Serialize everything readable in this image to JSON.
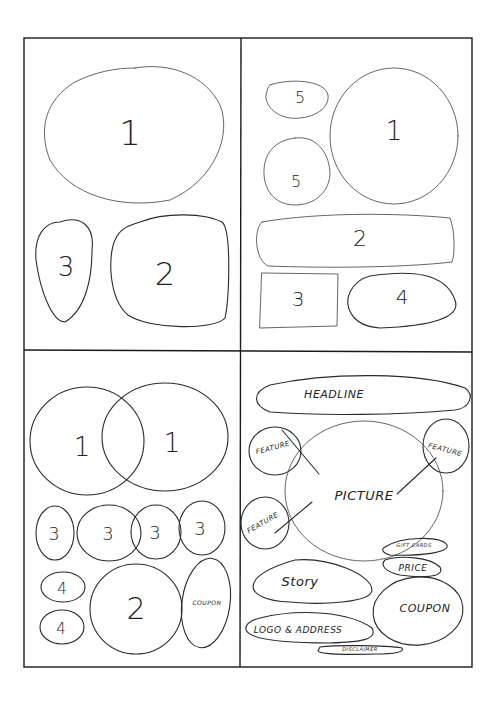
{
  "diagram": {
    "type": "hand-drawn layout wireframe sketches",
    "panels": [
      {
        "position": "top-left",
        "shapes": [
          {
            "id": "tl-1",
            "label": "1",
            "shape": "large oval"
          },
          {
            "id": "tl-3",
            "label": "3",
            "shape": "tall oval"
          },
          {
            "id": "tl-2",
            "label": "2",
            "shape": "rounded square"
          }
        ]
      },
      {
        "position": "top-right",
        "shapes": [
          {
            "id": "tr-5a",
            "label": "5",
            "shape": "small oval"
          },
          {
            "id": "tr-5b",
            "label": "5",
            "shape": "small circle"
          },
          {
            "id": "tr-1",
            "label": "1",
            "shape": "large circle"
          },
          {
            "id": "tr-2",
            "label": "2",
            "shape": "wide rounded bar"
          },
          {
            "id": "tr-3",
            "label": "3",
            "shape": "rectangle"
          },
          {
            "id": "tr-4",
            "label": "4",
            "shape": "oval"
          }
        ]
      },
      {
        "position": "bottom-left",
        "shapes": [
          {
            "id": "bl-1a",
            "label": "1",
            "shape": "large circle"
          },
          {
            "id": "bl-1b",
            "label": "1",
            "shape": "large circle (overlapping)"
          },
          {
            "id": "bl-3a",
            "label": "3",
            "shape": "small oval"
          },
          {
            "id": "bl-3b",
            "label": "3",
            "shape": "oval"
          },
          {
            "id": "bl-3c",
            "label": "3",
            "shape": "oval"
          },
          {
            "id": "bl-3d",
            "label": "3",
            "shape": "oval"
          },
          {
            "id": "bl-4a",
            "label": "4",
            "shape": "small oval"
          },
          {
            "id": "bl-4b",
            "label": "4",
            "shape": "small oval"
          },
          {
            "id": "bl-2",
            "label": "2",
            "shape": "large oval"
          },
          {
            "id": "bl-coupon",
            "label": "COUPON",
            "shape": "tall oval"
          }
        ]
      },
      {
        "position": "bottom-right",
        "shapes": [
          {
            "id": "br-headline",
            "label": "HEADLINE",
            "shape": "wide oval"
          },
          {
            "id": "br-feature-1",
            "label": "FEATURE",
            "shape": "small circle, top-left"
          },
          {
            "id": "br-feature-2",
            "label": "FEATURE",
            "shape": "small circle, top-right"
          },
          {
            "id": "br-feature-3",
            "label": "FEATURE",
            "shape": "small circle, left"
          },
          {
            "id": "br-picture",
            "label": "PICTURE",
            "shape": "large circle"
          },
          {
            "id": "br-giftcards",
            "label": "GIFT CARDS",
            "shape": "small oval"
          },
          {
            "id": "br-price",
            "label": "PRICE",
            "shape": "small oval"
          },
          {
            "id": "br-story",
            "label": "Story",
            "shape": "oval"
          },
          {
            "id": "br-logo",
            "label": "LOGO & ADDRESS",
            "shape": "wide oval"
          },
          {
            "id": "br-coupon",
            "label": "COUPON",
            "shape": "oval"
          },
          {
            "id": "br-disclaimer",
            "label": "DISCLAIMER",
            "shape": "thin oval"
          }
        ]
      }
    ]
  },
  "labels": {
    "tl": {
      "one": "1",
      "two": "2",
      "three": "3"
    },
    "tr": {
      "five_a": "5",
      "five_b": "5",
      "one": "1",
      "two": "2",
      "three": "3",
      "four": "4"
    },
    "bl": {
      "one_a": "1",
      "one_b": "1",
      "three_a": "3",
      "three_b": "3",
      "three_c": "3",
      "three_d": "3",
      "four_a": "4",
      "four_b": "4",
      "two": "2",
      "coupon": "COUPON"
    },
    "br": {
      "headline": "HEADLINE",
      "feature_1": "FEATURE",
      "feature_2": "FEATURE",
      "feature_3": "FEATURE",
      "picture": "PICTURE",
      "gift_cards": "GIFT CARDS",
      "price": "PRICE",
      "story": "Story",
      "logo_address": "LOGO & ADDRESS",
      "coupon": "COUPON",
      "disclaimer": "DISCLAIMER"
    }
  },
  "colors": {
    "ink": "#2a2a2a",
    "paper": "#ffffff"
  }
}
